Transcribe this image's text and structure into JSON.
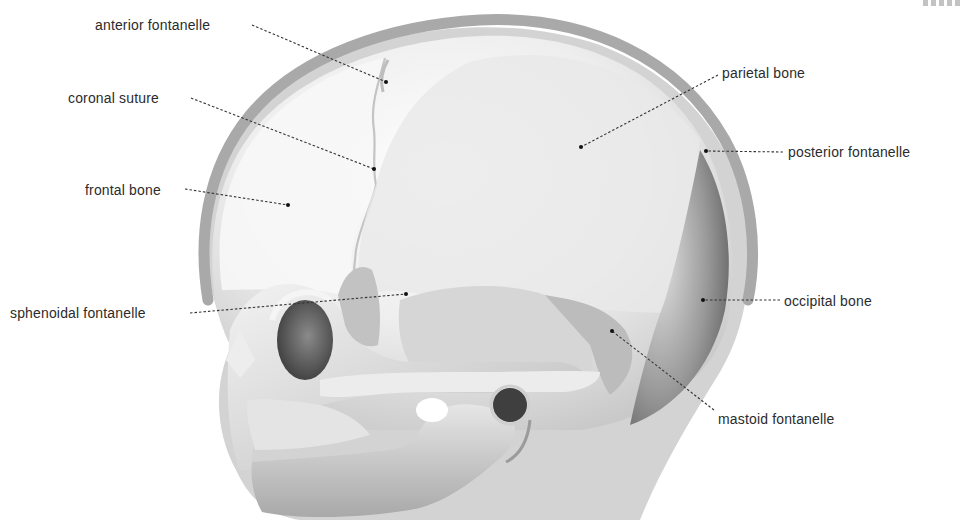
{
  "diagram": {
    "labels": [
      {
        "id": "anterior-fontanelle",
        "text": "anterior fontanelle",
        "x": 95,
        "y": 16,
        "align": "left",
        "line": [
          252,
          25,
          386,
          82
        ]
      },
      {
        "id": "coronal-suture",
        "text": "coronal suture",
        "x": 68,
        "y": 89,
        "align": "left",
        "line": [
          191,
          98,
          374,
          169
        ]
      },
      {
        "id": "frontal-bone",
        "text": "frontal bone",
        "x": 85,
        "y": 181,
        "align": "left",
        "line": [
          185,
          189,
          288,
          205
        ]
      },
      {
        "id": "parietal-bone",
        "text": "parietal bone",
        "x": 722,
        "y": 64,
        "align": "left",
        "line": [
          718,
          75,
          581,
          147
        ]
      },
      {
        "id": "posterior-fontanelle",
        "text": "posterior fontanelle",
        "x": 788,
        "y": 143,
        "align": "left",
        "line": [
          783,
          152,
          706,
          151
        ]
      },
      {
        "id": "sphenoidal-fontanelle",
        "text": "sphenoidal fontanelle",
        "x": 10,
        "y": 304,
        "align": "left",
        "line": [
          190,
          313,
          406,
          294
        ]
      },
      {
        "id": "occipital-bone",
        "text": "occipital bone",
        "x": 784,
        "y": 292,
        "align": "left",
        "line": [
          780,
          300,
          703,
          300
        ]
      },
      {
        "id": "mastoid-fontanelle",
        "text": "mastoid fontanelle",
        "x": 718,
        "y": 410,
        "align": "left",
        "line": [
          714,
          410,
          612,
          331
        ]
      }
    ],
    "colors": {
      "label_text": "#2b2b2b",
      "leader_line": "#333333",
      "scalp_outline": "#a8a8a8",
      "head_silhouette": "#d2d2d2",
      "bone_light": "#f4f4f4",
      "bone_mid": "#cfcfcf",
      "bone_dark": "#6e6e6e"
    }
  }
}
